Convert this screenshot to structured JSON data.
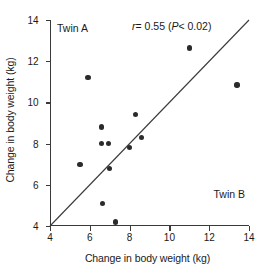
{
  "chart_data": {
    "type": "scatter",
    "title": "",
    "xlabel": "Change in body weight (kg)",
    "ylabel": "Change in body weight (kg)",
    "xlim": [
      4,
      14
    ],
    "ylim": [
      4,
      14
    ],
    "xticks": [
      "4",
      "6",
      "8",
      "10",
      "12",
      "14"
    ],
    "yticks": [
      "4",
      "6",
      "8",
      "10",
      "12",
      "14"
    ],
    "xtick_values": [
      4,
      6,
      8,
      10,
      12,
      14
    ],
    "ytick_values": [
      4,
      6,
      8,
      10,
      12,
      14
    ],
    "grid": false,
    "legend": "none",
    "series": [
      {
        "name": "Twin pairs",
        "marker": "filled-circle",
        "color": "#2b2b2b",
        "points": [
          {
            "x": 5.5,
            "y": 7.0
          },
          {
            "x": 5.9,
            "y": 11.2
          },
          {
            "x": 6.6,
            "y": 8.0
          },
          {
            "x": 6.6,
            "y": 8.8
          },
          {
            "x": 6.65,
            "y": 5.1
          },
          {
            "x": 6.95,
            "y": 8.0
          },
          {
            "x": 7.0,
            "y": 6.8
          },
          {
            "x": 7.3,
            "y": 4.2
          },
          {
            "x": 8.0,
            "y": 7.8
          },
          {
            "x": 8.3,
            "y": 9.4
          },
          {
            "x": 8.6,
            "y": 8.3
          },
          {
            "x": 11.0,
            "y": 12.65
          },
          {
            "x": 13.4,
            "y": 10.85
          }
        ]
      }
    ],
    "reference_line": {
      "name": "line-of-identity",
      "from": {
        "x": 4,
        "y": 4
      },
      "to": {
        "x": 14,
        "y": 14
      },
      "color": "#3a3a3a"
    },
    "annotations": {
      "statistic": "r = 0.55 (P < 0.02)",
      "statistic_symbol": "r",
      "statistic_value": "= 0.55 (",
      "statistic_p_symbol": "P",
      "statistic_p_value": "< 0.02)",
      "corner_top_left": "Twin A",
      "corner_bottom_right": "Twin B"
    }
  }
}
